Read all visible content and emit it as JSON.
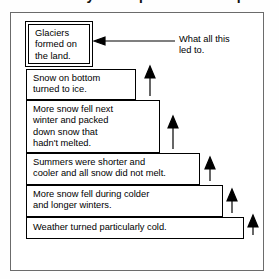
{
  "page": {
    "heading_partial": "Vocabulary — Sequence the Steps",
    "frame": {
      "border_color": "#6b6b6b"
    }
  },
  "diagram": {
    "type": "staircase-flowchart",
    "direction": "bottom-to-top",
    "line_color": "#000000",
    "background": "#ffffff",
    "steps": [
      {
        "id": "step-6",
        "order": 6,
        "emphasis": true,
        "lines": [
          "Glaciers",
          "formed on",
          "the land."
        ]
      },
      {
        "id": "step-5",
        "order": 5,
        "emphasis": false,
        "lines": [
          "Snow on bottom",
          "turned to ice."
        ]
      },
      {
        "id": "step-4",
        "order": 4,
        "emphasis": false,
        "lines": [
          "More snow fell next",
          "winter and packed",
          "down snow that",
          "hadn't melted."
        ]
      },
      {
        "id": "step-3",
        "order": 3,
        "emphasis": false,
        "lines": [
          "Summers were shorter and",
          "cooler and all snow did not melt."
        ]
      },
      {
        "id": "step-2",
        "order": 2,
        "emphasis": false,
        "lines": [
          "More snow fell during colder",
          "and longer winters."
        ]
      },
      {
        "id": "step-1",
        "order": 1,
        "emphasis": false,
        "lines": [
          "Weather turned particularly cold."
        ]
      }
    ],
    "callout": {
      "id": "callout-result",
      "lines": [
        "What all this",
        "led to."
      ],
      "points_to": "step-6"
    },
    "arrow_count": 5
  }
}
